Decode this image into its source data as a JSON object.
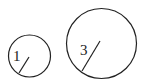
{
  "diagram": {
    "title": "",
    "circles": [
      {
        "id": "small",
        "radius_label": "1"
      },
      {
        "id": "large",
        "radius_label": "3"
      }
    ],
    "colors": {
      "stroke": "#222222",
      "background": "#ffffff"
    }
  }
}
